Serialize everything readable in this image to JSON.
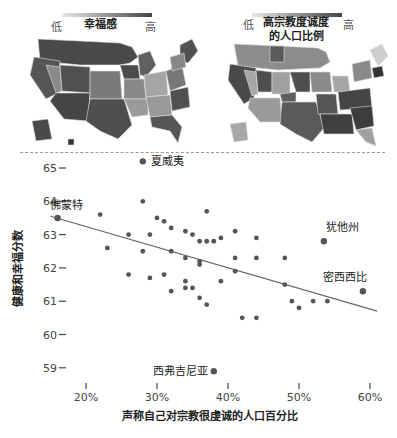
{
  "legends": {
    "left": {
      "low": "低",
      "high": "高",
      "title": "幸福感"
    },
    "right": {
      "low": "低",
      "high": "高",
      "title_line1": "高宗教度诚度",
      "title_line2": "的人口比例"
    }
  },
  "colors": {
    "dark": "#4a4a4a",
    "mid": "#7a7a7a",
    "light": "#a8a8a8",
    "lightest": "#cfcfcf",
    "point": "#555555",
    "trend": "#666666"
  },
  "chart_data": {
    "type": "scatter",
    "title": "",
    "xlabel": "声称自己对宗教很虔诚的人口百分比",
    "ylabel": "健康和幸福分数",
    "xlim": [
      13,
      63
    ],
    "ylim": [
      58.5,
      65.5
    ],
    "x_ticks": [
      "20%",
      "30%",
      "40%",
      "50%",
      "60%"
    ],
    "x_tick_values": [
      20,
      30,
      40,
      50,
      60
    ],
    "y_ticks": [
      "65",
      "64",
      "63",
      "62",
      "61",
      "60",
      "59"
    ],
    "y_tick_values": [
      65,
      64,
      63,
      62,
      61,
      60,
      59
    ],
    "grid": false,
    "trend_line": {
      "x": [
        15,
        61
      ],
      "y": [
        63.55,
        60.7
      ]
    },
    "labeled_points": [
      {
        "label": "夏威夷",
        "x": 28,
        "y": 65.2
      },
      {
        "label": "佛蒙特",
        "x": 16,
        "y": 63.5
      },
      {
        "label": "犹他州",
        "x": 53.5,
        "y": 62.8
      },
      {
        "label": "密西西比",
        "x": 59,
        "y": 61.3
      },
      {
        "label": "西弗吉尼亚",
        "x": 38,
        "y": 58.9
      }
    ],
    "points": [
      {
        "x": 22,
        "y": 63.6
      },
      {
        "x": 23,
        "y": 62.6
      },
      {
        "x": 26,
        "y": 63.0
      },
      {
        "x": 26,
        "y": 61.8
      },
      {
        "x": 28,
        "y": 64.0
      },
      {
        "x": 28,
        "y": 62.5
      },
      {
        "x": 29,
        "y": 63.0
      },
      {
        "x": 29,
        "y": 61.7
      },
      {
        "x": 30,
        "y": 63.5
      },
      {
        "x": 31,
        "y": 63.4
      },
      {
        "x": 31,
        "y": 61.8
      },
      {
        "x": 32,
        "y": 63.2
      },
      {
        "x": 32,
        "y": 62.5
      },
      {
        "x": 32,
        "y": 61.3
      },
      {
        "x": 34,
        "y": 63.1
      },
      {
        "x": 34,
        "y": 62.3
      },
      {
        "x": 34,
        "y": 61.6
      },
      {
        "x": 34,
        "y": 61.4
      },
      {
        "x": 35,
        "y": 63.0
      },
      {
        "x": 35,
        "y": 61.4
      },
      {
        "x": 36,
        "y": 62.8
      },
      {
        "x": 36,
        "y": 62.2
      },
      {
        "x": 36,
        "y": 62.1
      },
      {
        "x": 36,
        "y": 61.1
      },
      {
        "x": 37,
        "y": 63.7
      },
      {
        "x": 37,
        "y": 62.8
      },
      {
        "x": 37,
        "y": 60.9
      },
      {
        "x": 38,
        "y": 62.8
      },
      {
        "x": 39,
        "y": 62.9
      },
      {
        "x": 39,
        "y": 61.6
      },
      {
        "x": 41,
        "y": 63.1
      },
      {
        "x": 41,
        "y": 62.3
      },
      {
        "x": 41,
        "y": 61.9
      },
      {
        "x": 42,
        "y": 60.5
      },
      {
        "x": 44,
        "y": 62.3
      },
      {
        "x": 44,
        "y": 62.9
      },
      {
        "x": 44,
        "y": 60.5
      },
      {
        "x": 48,
        "y": 62.3
      },
      {
        "x": 48,
        "y": 61.5
      },
      {
        "x": 49,
        "y": 61.0
      },
      {
        "x": 50,
        "y": 60.8
      },
      {
        "x": 52,
        "y": 61.0
      },
      {
        "x": 54,
        "y": 61.0
      }
    ]
  }
}
